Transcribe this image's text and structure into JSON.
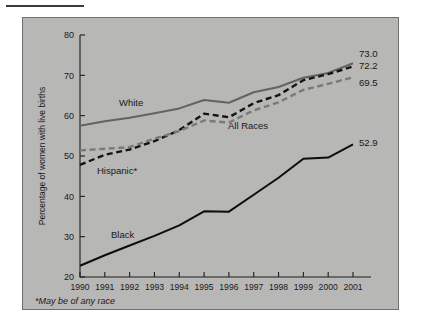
{
  "figure": {
    "footnote": "*May be of any race",
    "background_color": "#b7b7b5"
  },
  "chart_data": {
    "type": "line",
    "title": "",
    "xlabel": "",
    "ylabel": "Percentage of women with live births",
    "x": [
      1990,
      1991,
      1992,
      1993,
      1994,
      1995,
      1996,
      1997,
      1998,
      1999,
      2000,
      2001
    ],
    "xtick_labels": [
      "1990",
      "1991",
      "1992",
      "1993",
      "1994",
      "1995",
      "1996",
      "1997",
      "1998",
      "1999",
      "2000",
      "2001"
    ],
    "ytick_labels": [
      "20",
      "30",
      "40",
      "50",
      "60",
      "70",
      "80"
    ],
    "yticks": [
      20,
      30,
      40,
      50,
      60,
      70,
      80
    ],
    "ylim": [
      20,
      80
    ],
    "grid": false,
    "legend": "inline-annotations",
    "series": [
      {
        "name": "White",
        "label": "White",
        "color": "#63635f",
        "style": "solid",
        "end_value_label": "73.0",
        "values": [
          57.5,
          58.6,
          59.5,
          60.6,
          61.8,
          63.9,
          63.2,
          65.8,
          67.1,
          69.4,
          70.6,
          73.0
        ]
      },
      {
        "name": "All Races",
        "label": "All Races",
        "color": "#141414",
        "style": "dashed",
        "end_value_label": "72.2",
        "values": [
          47.8,
          50.3,
          51.6,
          53.7,
          56.4,
          60.5,
          59.6,
          63.1,
          65.1,
          68.8,
          70.3,
          72.2
        ]
      },
      {
        "name": "Hispanic*",
        "label": "Hispanic*",
        "color": "#7a7a76",
        "style": "dashed",
        "end_value_label": "69.5",
        "values": [
          51.4,
          51.8,
          52.2,
          54.3,
          56.2,
          58.8,
          58.3,
          61.3,
          63.3,
          66.4,
          67.9,
          69.5
        ]
      },
      {
        "name": "Black",
        "label": "Black",
        "color": "#0d0d0d",
        "style": "solid",
        "end_value_label": "52.9",
        "values": [
          22.8,
          25.4,
          27.8,
          30.2,
          32.8,
          36.3,
          36.2,
          40.4,
          44.6,
          49.3,
          49.6,
          52.9
        ]
      }
    ]
  }
}
